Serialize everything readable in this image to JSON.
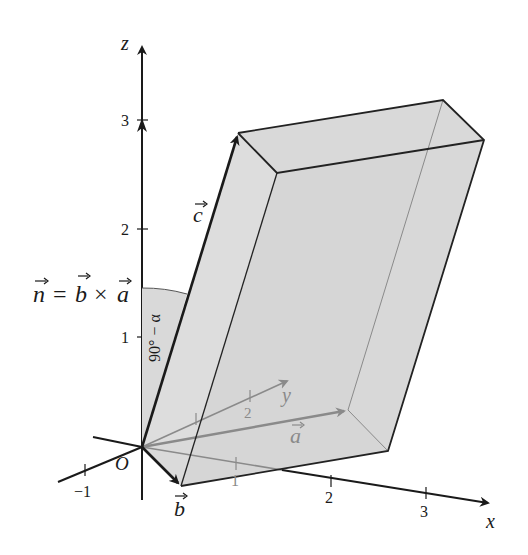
{
  "diagram": {
    "colors": {
      "axis": "#1a1a1a",
      "face_fill": "#d9d9d9",
      "hidden_edge": "#8a8a8a",
      "edge": "#222222"
    },
    "axes": {
      "x": {
        "label": "x",
        "ticks": [
          "1",
          "2",
          "3"
        ]
      },
      "y": {
        "label": "y",
        "ticks": [
          "1",
          "2"
        ],
        "negative_tick": "−1"
      },
      "z": {
        "label": "z",
        "ticks": [
          "1",
          "2",
          "3"
        ]
      }
    },
    "origin_label": "O",
    "vectors": {
      "a": "a",
      "b": "b",
      "c": "c",
      "n": "n"
    },
    "equation": {
      "lhs": "n",
      "equals": "=",
      "op1": "b",
      "times": "×",
      "op2": "a"
    },
    "angle_label": "90° − α"
  }
}
